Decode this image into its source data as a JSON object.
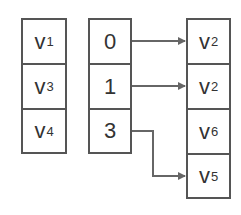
{
  "diagram": {
    "vertex_column": [
      {
        "letter": "v",
        "sub": "1"
      },
      {
        "letter": "v",
        "sub": "3"
      },
      {
        "letter": "v",
        "sub": "4"
      }
    ],
    "index_column": [
      "0",
      "1",
      "3"
    ],
    "target_column": [
      {
        "letter": "v",
        "sub": "2"
      },
      {
        "letter": "v",
        "sub": "2"
      },
      {
        "letter": "v",
        "sub": "6"
      },
      {
        "letter": "v",
        "sub": "5"
      }
    ],
    "edges": [
      {
        "from_index_row": 0,
        "to_target_row": 0
      },
      {
        "from_index_row": 1,
        "to_target_row": 1
      },
      {
        "from_index_row": 2,
        "to_target_row": 3
      }
    ],
    "colors": {
      "stroke": "#555555",
      "text": "#333333",
      "arrow": "#666666"
    }
  }
}
